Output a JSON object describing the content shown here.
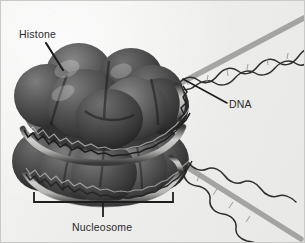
{
  "figure": {
    "background_color": "#f2f2f0",
    "border_color": "#c9c9c7",
    "width": 305,
    "height": 243
  },
  "labels": {
    "histone": "Histone",
    "dna": "DNA",
    "nucleosome": "Nucleosome"
  },
  "colors": {
    "histone_dark": "#3f3f3f",
    "histone_mid": "#585858",
    "histone_light": "#6e6e6e",
    "histone_shadow": "#262626",
    "dna_stroke": "#4a4a4a",
    "dna_highlight": "#d8d8d6",
    "leader_line": "#1d1d1d",
    "bracket": "#1d1d1d",
    "text": "#2a2a2a"
  },
  "structure": {
    "histone_core": {
      "description": "Two stacked discs of globular histone proteins forming the octamer core",
      "upper_disc_spheres": 5,
      "lower_disc_spheres": 5,
      "center_x": 103,
      "center_y": 120
    },
    "dna": {
      "description": "Double helix wrapped around the histone core and extending as linker DNA",
      "wraps": 2,
      "linker_upper_direction": "upper-right",
      "linker_lower_direction": "lower-right"
    }
  },
  "annotations": {
    "histone_leader": {
      "from_x": 45,
      "from_y": 42,
      "to_x": 62,
      "to_y": 68
    },
    "dna_leader": {
      "from_x": 225,
      "from_y": 103,
      "to_x": 183,
      "to_y": 78
    },
    "nucleosome_bracket": {
      "left_x": 33,
      "right_x": 172,
      "top_y": 200,
      "tick_x": 102,
      "tick_bottom_y": 214
    }
  }
}
